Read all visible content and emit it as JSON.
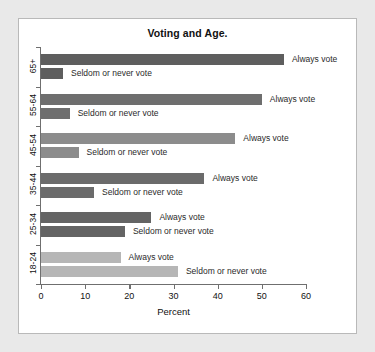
{
  "card": {
    "background_color": "#ffffff",
    "border_color": "#b9b9b9",
    "page_background_color": "#e9e9e9"
  },
  "chart_data": {
    "type": "bar",
    "orientation": "horizontal",
    "title": "Voting and Age.",
    "xlabel": "Percent",
    "ylabel": "",
    "xlim": [
      0,
      60
    ],
    "xticks": [
      0,
      10,
      20,
      30,
      40,
      50,
      60
    ],
    "xtick_labels": [
      "0",
      "10",
      "20",
      "30",
      "40",
      "50",
      "60"
    ],
    "grid": false,
    "legend": "inline-labels",
    "categories": [
      "65+",
      "55-64",
      "45-54",
      "35-44",
      "25-34",
      "18-24"
    ],
    "series": [
      {
        "name": "Always vote",
        "values": [
          55,
          50,
          44,
          37,
          25,
          18
        ]
      },
      {
        "name": "Seldom or never vote",
        "values": [
          5,
          6.5,
          8.5,
          12,
          19,
          31
        ]
      }
    ],
    "groups": [
      {
        "category": "65+",
        "color": "#5e5e5e",
        "bars": [
          {
            "label": "Always vote",
            "value": 55
          },
          {
            "label": "Seldom or never vote",
            "value": 5
          }
        ]
      },
      {
        "category": "55-64",
        "color": "#6e6e6e",
        "bars": [
          {
            "label": "Always vote",
            "value": 50
          },
          {
            "label": "Seldom or never vote",
            "value": 6.5
          }
        ]
      },
      {
        "category": "45-54",
        "color": "#8c8c8c",
        "bars": [
          {
            "label": "Always vote",
            "value": 44
          },
          {
            "label": "Seldom or never vote",
            "value": 8.5
          }
        ]
      },
      {
        "category": "35-44",
        "color": "#6b6b6b",
        "bars": [
          {
            "label": "Always vote",
            "value": 37
          },
          {
            "label": "Seldom or never vote",
            "value": 12
          }
        ]
      },
      {
        "category": "25-34",
        "color": "#646464",
        "bars": [
          {
            "label": "Always vote",
            "value": 25
          },
          {
            "label": "Seldom or never vote",
            "value": 19
          }
        ]
      },
      {
        "category": "18-24",
        "color": "#b6b6b6",
        "bars": [
          {
            "label": "Always vote",
            "value": 18
          },
          {
            "label": "Seldom or never vote",
            "value": 31
          }
        ]
      }
    ]
  }
}
